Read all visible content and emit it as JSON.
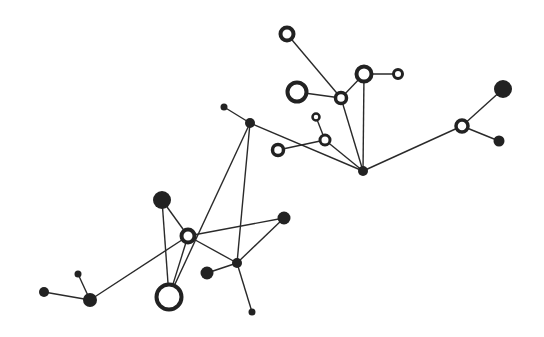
{
  "diagram": {
    "type": "network-graph",
    "colors": {
      "background": "#ffffff",
      "ink": "#222222",
      "edge": "#2a2a2a"
    },
    "nodes": [
      {
        "id": "n1",
        "x": 287,
        "y": 34,
        "r": 6.5,
        "style": "hollow",
        "stroke": 4
      },
      {
        "id": "n2",
        "x": 297,
        "y": 92,
        "r": 9.5,
        "style": "hollow",
        "stroke": 4
      },
      {
        "id": "n3",
        "x": 341,
        "y": 98,
        "r": 5.5,
        "style": "hollow",
        "stroke": 3.5
      },
      {
        "id": "n4",
        "x": 364,
        "y": 74,
        "r": 7.5,
        "style": "hollow",
        "stroke": 4
      },
      {
        "id": "n5",
        "x": 398,
        "y": 74,
        "r": 4.5,
        "style": "hollow",
        "stroke": 3
      },
      {
        "id": "n6",
        "x": 316,
        "y": 117,
        "r": 3.5,
        "style": "hollow",
        "stroke": 2.5
      },
      {
        "id": "n7",
        "x": 325,
        "y": 140,
        "r": 5,
        "style": "hollow",
        "stroke": 3
      },
      {
        "id": "n8",
        "x": 278,
        "y": 150,
        "r": 5.5,
        "style": "hollow",
        "stroke": 3.5
      },
      {
        "id": "n9",
        "x": 363,
        "y": 171,
        "r": 5,
        "style": "filled"
      },
      {
        "id": "n10",
        "x": 462,
        "y": 126,
        "r": 6,
        "style": "hollow",
        "stroke": 3.5
      },
      {
        "id": "n11",
        "x": 503,
        "y": 89,
        "r": 9,
        "style": "filled"
      },
      {
        "id": "n12",
        "x": 499,
        "y": 141,
        "r": 5.5,
        "style": "filled"
      },
      {
        "id": "n13",
        "x": 224,
        "y": 107,
        "r": 3.5,
        "style": "filled"
      },
      {
        "id": "n14",
        "x": 250,
        "y": 123,
        "r": 5,
        "style": "filled"
      },
      {
        "id": "n15",
        "x": 162,
        "y": 200,
        "r": 9,
        "style": "filled"
      },
      {
        "id": "n16",
        "x": 188,
        "y": 236,
        "r": 6.5,
        "style": "hollow",
        "stroke": 4
      },
      {
        "id": "n17",
        "x": 284,
        "y": 218,
        "r": 6.5,
        "style": "filled"
      },
      {
        "id": "n18",
        "x": 237,
        "y": 263,
        "r": 5,
        "style": "filled"
      },
      {
        "id": "n19",
        "x": 207,
        "y": 273,
        "r": 6.5,
        "style": "filled"
      },
      {
        "id": "n20",
        "x": 169,
        "y": 297,
        "r": 12.5,
        "style": "hollow",
        "stroke": 4
      },
      {
        "id": "n21",
        "x": 252,
        "y": 312,
        "r": 3.5,
        "style": "filled"
      },
      {
        "id": "n22",
        "x": 90,
        "y": 300,
        "r": 7,
        "style": "filled"
      },
      {
        "id": "n23",
        "x": 44,
        "y": 292,
        "r": 5,
        "style": "filled"
      },
      {
        "id": "n24",
        "x": 78,
        "y": 274,
        "r": 3.5,
        "style": "filled"
      }
    ],
    "edges": [
      [
        "n1",
        "n3"
      ],
      [
        "n2",
        "n3"
      ],
      [
        "n3",
        "n4"
      ],
      [
        "n4",
        "n5"
      ],
      [
        "n3",
        "n9"
      ],
      [
        "n4",
        "n9"
      ],
      [
        "n6",
        "n7"
      ],
      [
        "n8",
        "n7"
      ],
      [
        "n7",
        "n9"
      ],
      [
        "n9",
        "n10"
      ],
      [
        "n10",
        "n11"
      ],
      [
        "n10",
        "n12"
      ],
      [
        "n13",
        "n14"
      ],
      [
        "n14",
        "n9"
      ],
      [
        "n14",
        "n20"
      ],
      [
        "n14",
        "n18"
      ],
      [
        "n15",
        "n16"
      ],
      [
        "n15",
        "n20"
      ],
      [
        "n16",
        "n20"
      ],
      [
        "n16",
        "n17"
      ],
      [
        "n16",
        "n18"
      ],
      [
        "n16",
        "n22"
      ],
      [
        "n17",
        "n18"
      ],
      [
        "n19",
        "n18"
      ],
      [
        "n18",
        "n21"
      ],
      [
        "n22",
        "n23"
      ],
      [
        "n22",
        "n24"
      ]
    ]
  }
}
